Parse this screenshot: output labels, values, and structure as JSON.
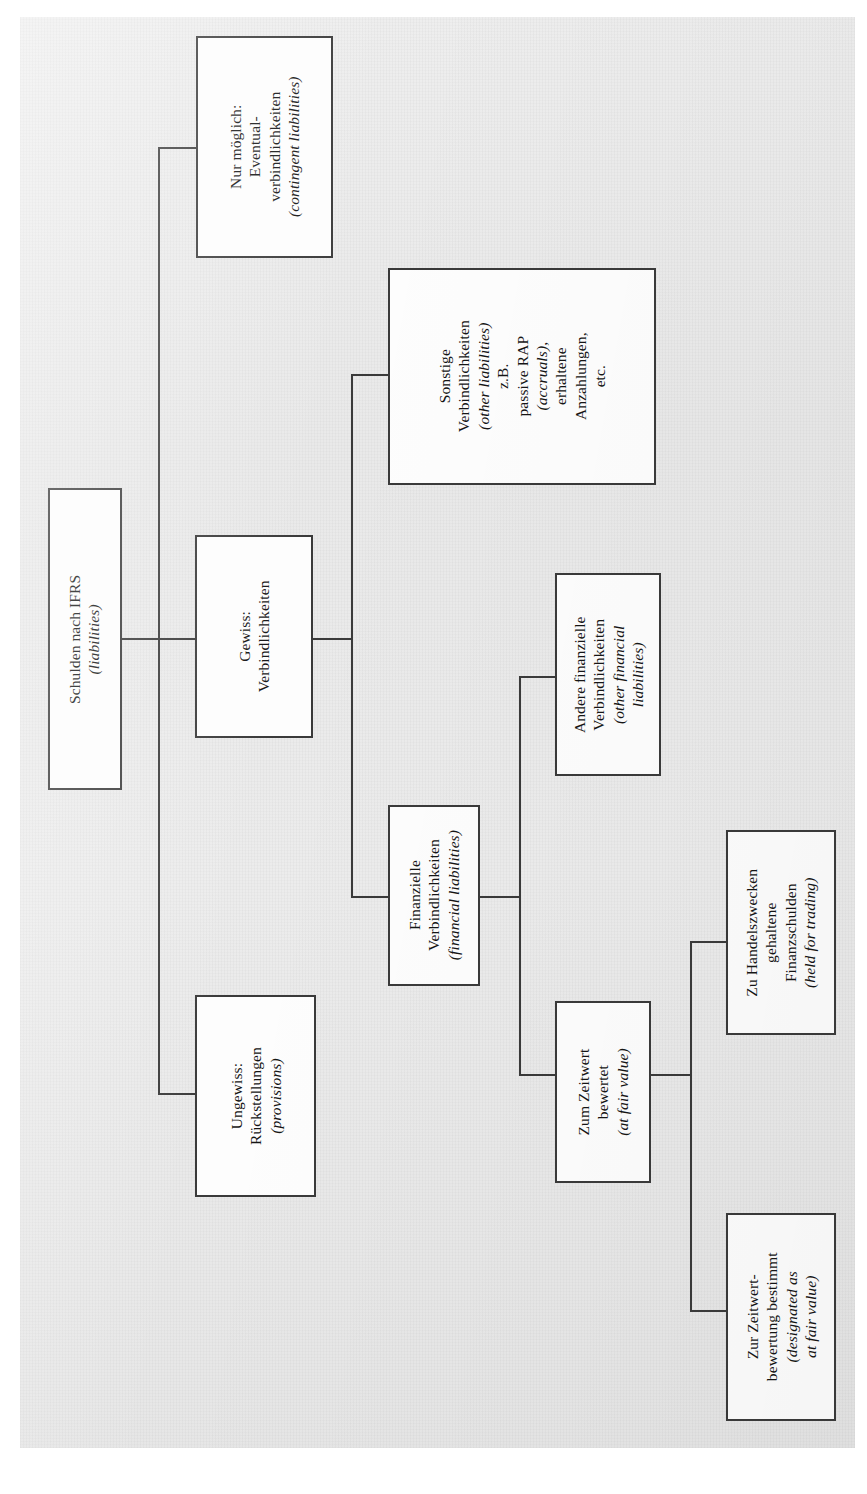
{
  "diagram": {
    "title_text": "Schulden nach IFRS (liabilities) Baumstruktur",
    "orientation": "rotated-90-left",
    "line_color": "#3a3a3a",
    "box_fill": "#fdfdfd",
    "page_background": "#ececec"
  },
  "nodes": {
    "root": {
      "id": "schulden-nach-ifrs",
      "lines": [
        "Schulden nach IFRS"
      ],
      "italic_lines": [
        "(liabilities)"
      ]
    },
    "gewiss": {
      "id": "gewiss-verbindlichkeiten",
      "lines": [
        "Gewiss:",
        "Verbindlichkeiten"
      ],
      "italic_lines": []
    },
    "ungewiss": {
      "id": "ungewiss-rueckstellungen",
      "lines": [
        "Ungewiss:",
        "Rückstellungen"
      ],
      "italic_lines": [
        "(provisions)"
      ]
    },
    "nur_moeglich": {
      "id": "nur-moeglich-eventualverbindlichkeiten",
      "lines": [
        "Nur möglich:",
        "Eventual-",
        "verbindlichkeiten"
      ],
      "italic_lines": [
        "(contingent liabilities)"
      ]
    },
    "sonstige": {
      "id": "sonstige-verbindlichkeiten",
      "lines": [
        "Sonstige",
        "Verbindlichkeiten"
      ],
      "italic_lines": [
        "(other liabilities)"
      ],
      "extra_lines": [
        "z.B.",
        "passive RAP"
      ],
      "extra_italic": [
        "(accruals),"
      ],
      "tail_lines": [
        "erhaltene",
        "Anzahlungen,",
        "etc."
      ]
    },
    "finanzielle": {
      "id": "finanzielle-verbindlichkeiten",
      "lines": [
        "Finanzielle",
        "Verbindlichkeiten"
      ],
      "italic_lines": [
        "(financial liabilities)"
      ]
    },
    "andere_finanzielle": {
      "id": "andere-finanzielle-verbindlichkeiten",
      "lines": [
        "Andere finanzielle",
        "Verbindlichkeiten"
      ],
      "italic_lines": [
        "(other financial",
        "liabilities)"
      ]
    },
    "zum_zeitwert": {
      "id": "zum-zeitwert-bewertet",
      "lines": [
        "Zum Zeitwert",
        "bewertet"
      ],
      "italic_lines": [
        "(at fair value)"
      ]
    },
    "handelszwecke": {
      "id": "zu-handelszwecken-gehaltene-finanzschulden",
      "lines": [
        "Zu Handelszwecken",
        "gehaltene",
        "Finanzschulden"
      ],
      "italic_lines": [
        "(held for trading)"
      ]
    },
    "zeitwertbewertung": {
      "id": "zur-zeitwertbewertung-bestimmt",
      "lines": [
        "Zur Zeitwert-",
        "bewertung bestimmt"
      ],
      "italic_lines": [
        "(designated as",
        "at fair value)"
      ]
    }
  }
}
